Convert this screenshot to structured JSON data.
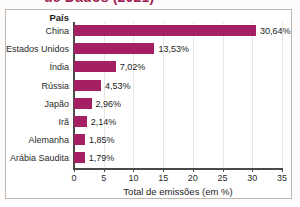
{
  "title": {
    "text_clipped": "de Dados (2021)"
  },
  "chart_data": {
    "type": "bar",
    "orientation": "horizontal",
    "title": "",
    "xlabel": "Total de emissões (em %)",
    "ylabel": "País",
    "categories": [
      "China",
      "Estados Unidos",
      "Índia",
      "Rússia",
      "Japão",
      "Irã",
      "Alemanha",
      "Arábia Saudita"
    ],
    "values": [
      30.64,
      13.53,
      7.02,
      4.53,
      2.96,
      2.14,
      1.85,
      1.79
    ],
    "value_labels": [
      "30,64%",
      "13,53%",
      "7,02%",
      "4,53%",
      "2,96%",
      "2,14%",
      "1,85%",
      "1,79%"
    ],
    "xlim": [
      0,
      35
    ],
    "xticks": [
      0,
      5,
      10,
      15,
      20,
      25,
      30,
      35
    ],
    "xtick_labels": [
      "0",
      "5",
      "10",
      "15",
      "20",
      "25",
      "30",
      "35"
    ],
    "grid": "vertical",
    "legend": "none",
    "bar_color": "#a52063",
    "axis_color": "#4a4a4a",
    "gridline_color": "#e9e7e6"
  }
}
